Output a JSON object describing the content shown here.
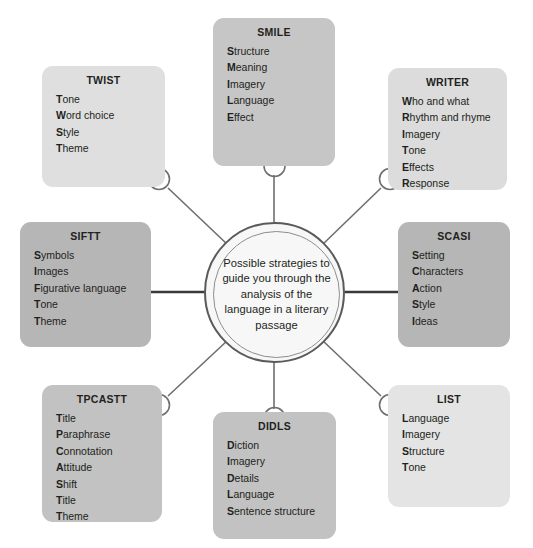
{
  "diagram": {
    "kind": "radial-concept-map",
    "center": {
      "text": "Possible strategies to guide you through the analysis of the language in a literary passage",
      "ring_outer_color": "#5a5a5a",
      "ring_inner_color": "#8d8d8d",
      "fill": "#f7f7f7"
    },
    "connector": {
      "line_color": "#6f6f6f",
      "loop_color": "#6f6f6f",
      "strong_line_color": "#3a3a3a"
    },
    "nodes": [
      {
        "id": "smile",
        "title": "SMILE",
        "fill": "#c6c6c6",
        "items": [
          {
            "initial": "S",
            "rest": "tructure"
          },
          {
            "initial": "M",
            "rest": "eaning"
          },
          {
            "initial": "I",
            "rest": "magery"
          },
          {
            "initial": "L",
            "rest": "anguage"
          },
          {
            "initial": "E",
            "rest": "ffect"
          }
        ]
      },
      {
        "id": "twist",
        "title": "TWIST",
        "fill": "#dfdfdf",
        "items": [
          {
            "initial": "T",
            "rest": "one"
          },
          {
            "initial": "W",
            "rest": "ord choice"
          },
          {
            "initial": "S",
            "rest": "tyle"
          },
          {
            "initial": "T",
            "rest": "heme"
          }
        ]
      },
      {
        "id": "writer",
        "title": "WRITER",
        "fill": "#dcdcdc",
        "items": [
          {
            "initial": "W",
            "rest": "ho and what"
          },
          {
            "initial": "R",
            "rest": "hythm and rhyme"
          },
          {
            "initial": "I",
            "rest": "magery"
          },
          {
            "initial": "T",
            "rest": "one"
          },
          {
            "initial": "E",
            "rest": "ffects"
          },
          {
            "initial": "R",
            "rest": "esponse"
          }
        ]
      },
      {
        "id": "siftt",
        "title": "SIFTT",
        "fill": "#b6b6b6",
        "items": [
          {
            "initial": "S",
            "rest": "ymbols"
          },
          {
            "initial": "I",
            "rest": "mages"
          },
          {
            "initial": "F",
            "rest": "igurative language"
          },
          {
            "initial": "T",
            "rest": "one"
          },
          {
            "initial": "T",
            "rest": "heme"
          }
        ]
      },
      {
        "id": "scasi",
        "title": "SCASI",
        "fill": "#b6b6b6",
        "items": [
          {
            "initial": "S",
            "rest": "etting"
          },
          {
            "initial": "C",
            "rest": "haracters"
          },
          {
            "initial": "A",
            "rest": "ction"
          },
          {
            "initial": "S",
            "rest": "tyle"
          },
          {
            "initial": "I",
            "rest": "deas"
          }
        ]
      },
      {
        "id": "tpcastt",
        "title": "TPCASTT",
        "fill": "#c2c2c2",
        "items": [
          {
            "initial": "T",
            "rest": "itle"
          },
          {
            "initial": "P",
            "rest": "araphrase"
          },
          {
            "initial": "C",
            "rest": "onnotation"
          },
          {
            "initial": "A",
            "rest": "ttitude"
          },
          {
            "initial": "S",
            "rest": "hift"
          },
          {
            "initial": "T",
            "rest": "itle"
          },
          {
            "initial": "T",
            "rest": "heme"
          }
        ]
      },
      {
        "id": "didls",
        "title": "DIDLS",
        "fill": "#c2c2c2",
        "items": [
          {
            "initial": "D",
            "rest": "iction"
          },
          {
            "initial": "I",
            "rest": "magery"
          },
          {
            "initial": "D",
            "rest": "etails"
          },
          {
            "initial": "L",
            "rest": "anguage"
          },
          {
            "initial": "S",
            "rest": "entence structure"
          }
        ]
      },
      {
        "id": "list",
        "title": "LIST",
        "fill": "#e4e4e4",
        "items": [
          {
            "initial": "L",
            "rest": "anguage"
          },
          {
            "initial": "I",
            "rest": "magery"
          },
          {
            "initial": "S",
            "rest": "tructure"
          },
          {
            "initial": "T",
            "rest": "one"
          }
        ]
      }
    ]
  }
}
